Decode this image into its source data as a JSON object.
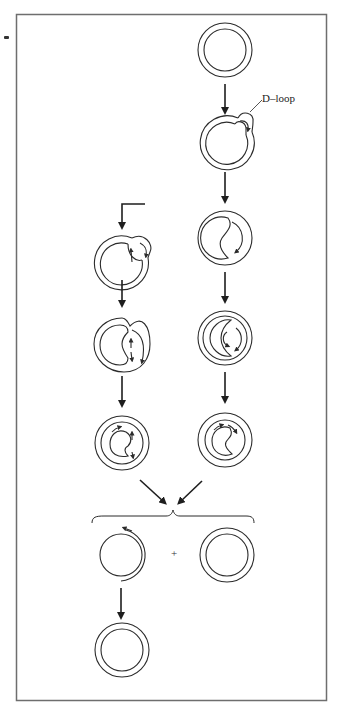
{
  "figure": {
    "labels": {
      "d_loop": "D–loop",
      "plus": "+"
    },
    "colors": {
      "stroke": "#2b2b2b",
      "frame": "#6e6e6e",
      "background": "#ffffff"
    },
    "steps": {
      "right_column": [
        "circular duplex",
        "D-loop formation",
        "displacement synthesis",
        "continued synthesis",
        "nearly complete synthesis"
      ],
      "left_column": [
        "lagging strand initiation",
        "both strands synthesizing",
        "nearly complete synthesis"
      ],
      "products": [
        "gapped daughter circle",
        "complete daughter circle",
        "repaired daughter circle"
      ]
    }
  }
}
